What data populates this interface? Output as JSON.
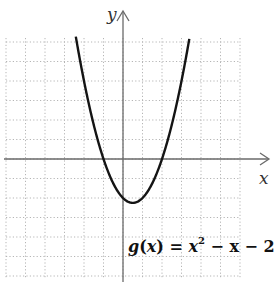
{
  "chart_data": {
    "type": "line",
    "title": "",
    "function_label": "g(x) = x² − x − 2",
    "function_parts": {
      "name": "g",
      "var": "x",
      "rhs_a": "x",
      "exp": "2",
      "rhs_b": " − x − 2"
    },
    "xlabel": "x",
    "ylabel": "y",
    "xlim": [
      -6,
      6
    ],
    "ylim": [
      -6,
      6
    ],
    "grid": true,
    "grid_style": "dotted",
    "tick_labels": false,
    "series": [
      {
        "name": "g(x) = x^2 - x - 2",
        "x": [
          -2.4,
          -2,
          -1.5,
          -1,
          -0.5,
          0,
          0.5,
          1,
          1.5,
          2,
          2.5,
          3,
          3.4
        ],
        "values": [
          6.16,
          4,
          1.75,
          0,
          -1.25,
          -2,
          -2.25,
          -2,
          -1.25,
          0,
          1.75,
          4,
          6.16
        ]
      }
    ],
    "key_points": {
      "vertex": [
        0.5,
        -2.25
      ],
      "x_intercepts": [
        -1,
        2
      ],
      "y_intercept": -2
    }
  },
  "colors": {
    "curve": "#141414",
    "axis": "#6a6a6a",
    "grid": "#b5b5b5"
  }
}
